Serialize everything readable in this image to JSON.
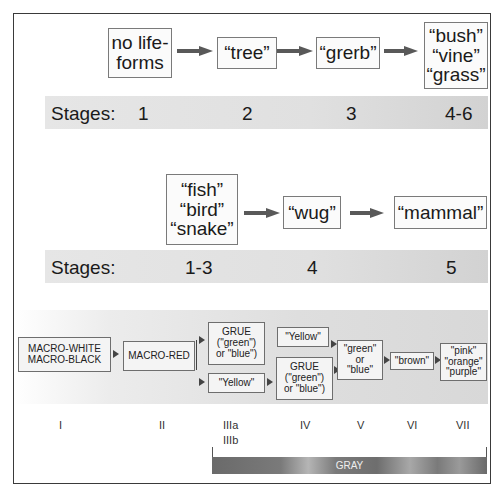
{
  "panel_a": {
    "boxes": [
      {
        "label": "no life-\nforms"
      },
      {
        "label": "“tree”"
      },
      {
        "label": "“grerb”"
      },
      {
        "label": "“bush”\n“vine”\n“grass”"
      }
    ],
    "stages_label": "Stages:",
    "stages": [
      "1",
      "2",
      "3",
      "4-6"
    ]
  },
  "panel_b": {
    "boxes": [
      {
        "label": "“fish”\n“bird”\n“snake”"
      },
      {
        "label": "“wug”"
      },
      {
        "label": "“mammal”"
      }
    ],
    "stages_label": "Stages:",
    "stages": [
      "1-3",
      "4",
      "5"
    ]
  },
  "panel_c": {
    "boxes": {
      "macro_white_black": "MACRO-WHITE\nMACRO-BLACK",
      "macro_red": "MACRO-RED",
      "grue_upper": "GRUE\n(\"green\")\nor \"blue\")",
      "yellow_lower": "\"Yellow\"",
      "yellow_upper": "\"Yellow\"",
      "grue_lower": "GRUE\n(\"green\")\nor \"blue\")",
      "green_or_blue": "\"green\"\nor\n\"blue\"",
      "brown": "\"brown\"",
      "pink_orange_purple": "\"pink\"\n\"orange\"\n\"purple\""
    },
    "stages": [
      "I",
      "II",
      "IIIa\nIIIb",
      "IV",
      "V",
      "VI",
      "VII"
    ],
    "gray_label": "GRAY"
  },
  "colors": {
    "arrow": "#595959",
    "box_border": "#7a7a7a",
    "stage_bar": "#e0e0e0",
    "gray_bar": "#7a7a7a"
  }
}
